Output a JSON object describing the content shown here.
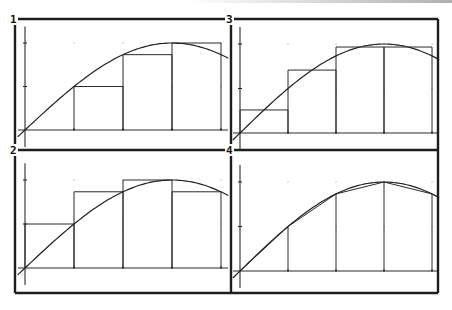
{
  "screen": {
    "width": 452,
    "height": 310,
    "colors": {
      "ink": "#1e1e1e",
      "background": "#ffffff",
      "grid_dot": "#b5b5b5"
    },
    "frame": {
      "left": 15,
      "right": 438,
      "top": 19,
      "bottom": 293,
      "split_x": 231,
      "split_y": 150
    }
  },
  "chart_data": [
    {
      "pane_label": "1",
      "type": "line",
      "method": "left-endpoint Riemann sum",
      "function": "2*sin(pi*x/6)",
      "x": [
        0,
        1,
        2,
        3,
        4
      ],
      "curve_values": [
        0,
        1.0,
        1.732,
        2.0,
        1.732
      ],
      "rect_intervals": [
        [
          0,
          1
        ],
        [
          1,
          2
        ],
        [
          2,
          3
        ],
        [
          3,
          4
        ]
      ],
      "rect_heights": [
        0,
        1.0,
        1.732,
        2.0
      ],
      "xlim": [
        -0.15,
        4.15
      ],
      "ylim": [
        -0.4,
        2.3
      ],
      "x_ticks": [
        1,
        2,
        3,
        4
      ],
      "y_ticks": [
        1,
        2
      ],
      "grid": "dots",
      "layout": {
        "origin": [
          25,
          130
        ],
        "sx": 49,
        "sy": 43.5,
        "label_pos": [
          13,
          19
        ]
      }
    },
    {
      "pane_label": "2",
      "type": "line",
      "method": "right-endpoint Riemann sum",
      "function": "2*sin(pi*x/6)",
      "x": [
        0,
        1,
        2,
        3,
        4
      ],
      "curve_values": [
        0,
        1.0,
        1.732,
        2.0,
        1.732
      ],
      "rect_intervals": [
        [
          0,
          1
        ],
        [
          1,
          2
        ],
        [
          2,
          3
        ],
        [
          3,
          4
        ]
      ],
      "rect_heights": [
        1.0,
        1.732,
        2.0,
        1.732
      ],
      "xlim": [
        -0.15,
        4.15
      ],
      "ylim": [
        -0.4,
        2.3
      ],
      "x_ticks": [
        1,
        2,
        3,
        4
      ],
      "y_ticks": [
        1,
        2
      ],
      "grid": "dots",
      "layout": {
        "origin": [
          25,
          268
        ],
        "sx": 49,
        "sy": 44,
        "label_pos": [
          13,
          150
        ]
      }
    },
    {
      "pane_label": "3",
      "type": "line",
      "method": "midpoint Riemann sum",
      "function": "2*sin(pi*x/6)",
      "x": [
        0,
        1,
        2,
        3,
        4
      ],
      "curve_values": [
        0,
        1.0,
        1.732,
        2.0,
        1.732
      ],
      "rect_intervals": [
        [
          0,
          1
        ],
        [
          1,
          2
        ],
        [
          2,
          3
        ],
        [
          3,
          4
        ]
      ],
      "rect_heights": [
        0.518,
        1.414,
        1.932,
        1.932
      ],
      "xlim": [
        -0.15,
        4.15
      ],
      "ylim": [
        -0.4,
        2.3
      ],
      "x_ticks": [
        1,
        2,
        3,
        4
      ],
      "y_ticks": [
        1,
        2
      ],
      "grid": "dots",
      "layout": {
        "origin": [
          240,
          133
        ],
        "sx": 48,
        "sy": 44.5,
        "label_pos": [
          228,
          19
        ]
      }
    },
    {
      "pane_label": "4",
      "type": "line",
      "method": "trapezoid rule",
      "function": "2*sin(pi*x/6)",
      "x": [
        0,
        1,
        2,
        3,
        4
      ],
      "curve_values": [
        0,
        1.0,
        1.732,
        2.0,
        1.732
      ],
      "trapezoid_vertices": [
        [
          0,
          0
        ],
        [
          1,
          1.0
        ],
        [
          2,
          1.732
        ],
        [
          3,
          2.0
        ],
        [
          4,
          1.732
        ]
      ],
      "xlim": [
        -0.15,
        4.15
      ],
      "ylim": [
        -0.4,
        2.3
      ],
      "x_ticks": [
        1,
        2,
        3,
        4
      ],
      "y_ticks": [
        1,
        2
      ],
      "grid": "dots",
      "layout": {
        "origin": [
          240,
          271
        ],
        "sx": 48,
        "sy": 44.5,
        "label_pos": [
          228,
          150
        ]
      }
    }
  ]
}
